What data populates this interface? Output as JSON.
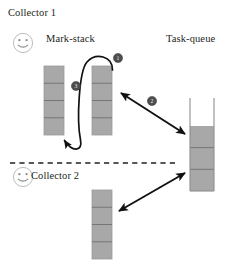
{
  "figure": {
    "background_color": "#ffffff",
    "ink_color": "#231f20",
    "block_fill": "#a8a8a8",
    "block_stroke": "#8a8a8a",
    "face_stroke": "#b9b9b9",
    "marker_fill": "#4d4d4d",
    "marker_text_color": "#f2f2f2"
  },
  "labels": {
    "collector1": "Collector 1",
    "collector2": "Collector 2",
    "mark_stack": "Mark-stack",
    "task_queue": "Task-queue"
  },
  "markers": [
    {
      "id": "marker-1",
      "text": "1",
      "x": 118,
      "y": 58,
      "r": 4.6
    },
    {
      "id": "marker-3",
      "text": "3",
      "x": 76,
      "y": 86,
      "r": 4.6
    },
    {
      "id": "marker-2",
      "text": "2",
      "x": 152,
      "y": 101,
      "r": 4.6
    }
  ],
  "stacks": [
    {
      "id": "mark-stack-c1-left",
      "owner": "Collector 1",
      "kind": "mark-stack",
      "x": 44,
      "y": 66,
      "width": 20,
      "height": 69,
      "segments": 4
    },
    {
      "id": "mark-stack-c1-right",
      "owner": "Collector 1",
      "kind": "mark-stack",
      "x": 92,
      "y": 66,
      "width": 20,
      "height": 69,
      "segments": 4
    },
    {
      "id": "mark-stack-c2",
      "owner": "Collector 2",
      "kind": "mark-stack",
      "x": 92,
      "y": 190,
      "width": 20,
      "height": 69,
      "segments": 4
    }
  ],
  "task_queue": {
    "id": "task-queue-container",
    "x": 190,
    "y": 98,
    "width": 24,
    "height": 93,
    "fill_top": 126,
    "fill_segments": 3,
    "open_top": true
  },
  "divider": {
    "id": "collector-divider",
    "x1": 10,
    "y1": 163,
    "x2": 176,
    "y2": 163,
    "style": "dashed"
  },
  "faces": [
    {
      "id": "face-collector1",
      "cx": 23,
      "cy": 43,
      "r": 10
    },
    {
      "id": "face-collector2",
      "cx": 23,
      "cy": 177,
      "r": 10
    }
  ],
  "arrows": [
    {
      "id": "arrow-push-pop-loop",
      "kind": "curved",
      "from": "mark-stack-c1-right top",
      "to": "mark-stack-c1-left bottom",
      "double_headed": false
    },
    {
      "id": "arrow-c1-taskqueue",
      "kind": "straight",
      "from": "mark-stack-c1-right",
      "to": "task-queue-container",
      "double_headed": true
    },
    {
      "id": "arrow-c2-taskqueue",
      "kind": "straight",
      "from": "mark-stack-c2",
      "to": "task-queue-container",
      "double_headed": true
    }
  ]
}
